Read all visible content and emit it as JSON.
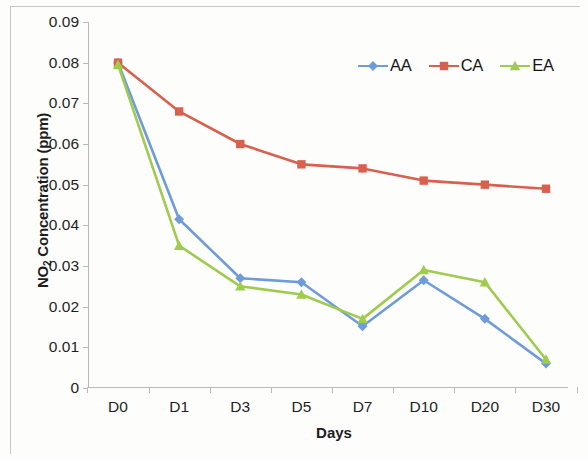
{
  "chart_data": {
    "type": "line",
    "title": "",
    "xlabel": "Days",
    "ylabel": "NO2 Concentration (ppm)",
    "ylabel_main": "Concentration (ppm)",
    "ylabel_prefix": "NO",
    "ylabel_sub": "2",
    "categories": [
      "D0",
      "D1",
      "D3",
      "D5",
      "D7",
      "D10",
      "D20",
      "D30"
    ],
    "ylim": [
      0,
      0.09
    ],
    "ytick_values": [
      0,
      0.01,
      0.02,
      0.03,
      0.04,
      0.05,
      0.06,
      0.07,
      0.08,
      0.09
    ],
    "ytick_labels": [
      "0",
      "0.01",
      "0.02",
      "0.03",
      "0.04",
      "0.05",
      "0.06",
      "0.07",
      "0.08",
      "0.09"
    ],
    "grid": false,
    "legend_position": "top-right",
    "series": [
      {
        "name": "AA",
        "color": "#6f9bd8",
        "marker": "diamond",
        "values": [
          0.08,
          0.0415,
          0.027,
          0.026,
          0.0152,
          0.0265,
          0.017,
          0.006
        ]
      },
      {
        "name": "CA",
        "color": "#d9604f",
        "marker": "square",
        "values": [
          0.08,
          0.068,
          0.06,
          0.055,
          0.054,
          0.051,
          0.05,
          0.049
        ]
      },
      {
        "name": "EA",
        "color": "#9fcb4e",
        "marker": "triangle",
        "values": [
          0.0795,
          0.035,
          0.025,
          0.023,
          0.017,
          0.029,
          0.026,
          0.007
        ]
      }
    ]
  },
  "legend": {
    "entries": [
      {
        "label": "AA"
      },
      {
        "label": "CA"
      },
      {
        "label": "EA"
      }
    ]
  },
  "axes": {
    "x_title": "Days",
    "y_title_prefix": "NO",
    "y_title_sub": "2",
    "y_title_rest": " Concentration (ppm)"
  }
}
